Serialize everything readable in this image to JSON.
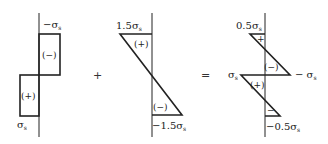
{
  "figures": [
    {
      "id": "uniform",
      "labels": {
        "top": "−σ",
        "top_sub": "s",
        "bottom": "σ",
        "bottom_sub": "s"
      },
      "regions": {
        "upper": "(−)",
        "lower": "(+)"
      }
    },
    {
      "id": "linear",
      "labels": {
        "top": "1.5σ",
        "top_sub": "s",
        "bottom": "−1.5σ",
        "bottom_sub": "s"
      },
      "regions": {
        "upper": "(+)",
        "lower": "(−)"
      }
    },
    {
      "id": "result",
      "labels": {
        "top": "0.5σ",
        "top_sub": "s",
        "mid_left": "σ",
        "mid_left_sub": "s",
        "mid_right": "− σ",
        "mid_right_sub": "s",
        "bottom": "−0.5σ",
        "bottom_sub": "s"
      },
      "regions": {
        "top": "+",
        "upper": "(−)",
        "lower": "(+)",
        "bottom": "−"
      }
    }
  ],
  "operators": {
    "plus": "+",
    "equals": "="
  }
}
